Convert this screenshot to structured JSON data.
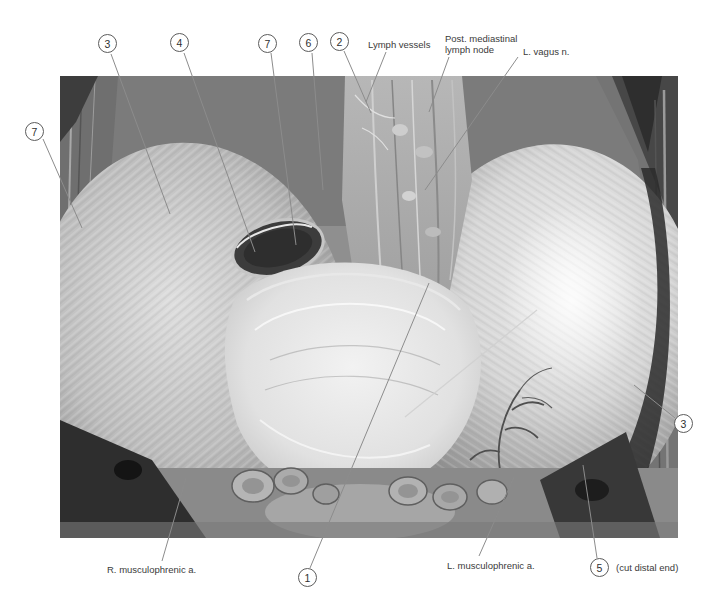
{
  "figure": {
    "colors": {
      "background": "#ffffff",
      "text": "#3a3a3a",
      "leader_line": "#8c8c8c",
      "circle_border": "#5c5c5c",
      "circle_fill": "#ffffff"
    },
    "photo_frame": {
      "x": 60,
      "y": 76,
      "width": 618,
      "height": 462
    },
    "callouts": [
      {
        "id": "callout-7-left",
        "number": "7",
        "cx": 35,
        "cy": 132,
        "line": [
          43,
          139,
          82,
          228
        ]
      },
      {
        "id": "callout-3-top",
        "number": "3",
        "cx": 108,
        "cy": 44,
        "line": [
          111,
          54,
          170,
          214
        ]
      },
      {
        "id": "callout-4-top",
        "number": "4",
        "cx": 180,
        "cy": 43,
        "line": [
          184,
          53,
          255,
          252
        ]
      },
      {
        "id": "callout-7-top",
        "number": "7",
        "cx": 268,
        "cy": 44,
        "line": [
          271,
          53,
          296,
          245
        ]
      },
      {
        "id": "callout-6-top",
        "number": "6",
        "cx": 309,
        "cy": 43,
        "line": [
          312,
          53,
          323,
          190
        ]
      },
      {
        "id": "callout-2-top",
        "number": "2",
        "cx": 340,
        "cy": 42,
        "line": [
          344,
          51,
          371,
          113
        ]
      },
      {
        "id": "callout-3-right",
        "number": "3",
        "cx": 684,
        "cy": 424,
        "line": [
          675,
          418,
          634,
          385
        ]
      },
      {
        "id": "callout-1-bottom",
        "number": "1",
        "cx": 308,
        "cy": 578,
        "line": [
          310,
          568,
          429,
          283
        ]
      },
      {
        "id": "callout-5-bottom",
        "number": "5",
        "cx": 600,
        "cy": 568,
        "suffix": "(cut distal end)",
        "line": [
          597,
          558,
          583,
          465
        ]
      }
    ],
    "text_labels": [
      {
        "id": "label-lymph-vessels",
        "lines_of_text": [
          "Lymph vessels"
        ],
        "x": 368,
        "y": 39,
        "line": [
          386,
          52,
          366,
          102
        ]
      },
      {
        "id": "label-post-mediastinal",
        "lines_of_text": [
          "Post. mediastinal",
          "lymph node"
        ],
        "x": 445,
        "y": 33,
        "line": [
          449,
          57,
          429,
          112
        ]
      },
      {
        "id": "label-l-vagus",
        "lines_of_text": [
          "L. vagus n."
        ],
        "x": 523,
        "y": 46,
        "line": [
          518,
          57,
          425,
          190
        ]
      },
      {
        "id": "label-r-musculophrenic",
        "lines_of_text": [
          "R. musculophrenic a."
        ],
        "x": 107,
        "y": 564,
        "line": [
          162,
          561,
          186,
          478
        ]
      },
      {
        "id": "label-l-musculophrenic",
        "lines_of_text": [
          "L. musculophrenic a."
        ],
        "x": 447,
        "y": 560,
        "line": [
          479,
          556,
          514,
          477
        ]
      }
    ]
  }
}
